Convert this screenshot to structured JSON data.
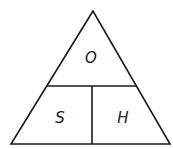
{
  "diagram": {
    "type": "formula-triangle",
    "top_label": "O",
    "bottom_left_label": "S",
    "bottom_right_label": "H",
    "stroke_color": "#1a1a1a",
    "background_color": "#ffffff"
  }
}
